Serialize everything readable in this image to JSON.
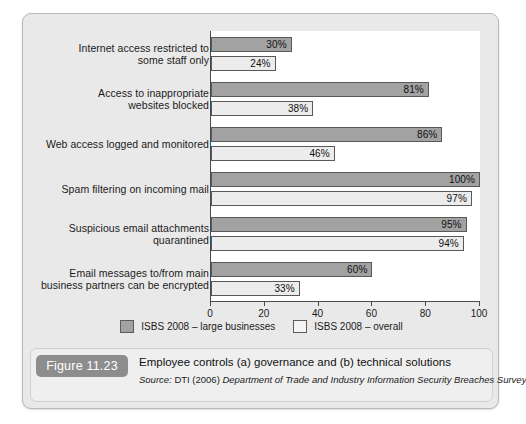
{
  "figure": {
    "badge": "Figure 11.23",
    "title": "Employee controls (a) governance and (b) technical solutions",
    "source_prefix": "Source:",
    "source_org": " DTI (2006) ",
    "source_title": "Department of Trade and Industry Information Security Breaches Survey"
  },
  "legend": {
    "items": [
      {
        "label": "ISBS 2008 – large businesses",
        "color": "#a2a2a2",
        "key": "large"
      },
      {
        "label": "ISBS 2008 – overall",
        "color": "#f4f4f4",
        "key": "overall"
      }
    ]
  },
  "chart_data": {
    "type": "bar",
    "orientation": "horizontal",
    "title": "Employee controls (a) governance and (b) technical solutions",
    "xlabel": "",
    "ylabel": "",
    "xlim": [
      0,
      100
    ],
    "xticks": [
      0,
      20,
      40,
      60,
      80,
      100
    ],
    "xtick_labels": [
      "0",
      "20",
      "40",
      "60",
      "80",
      "100"
    ],
    "grid": false,
    "legend_position": "bottom",
    "value_suffix": "%",
    "categories": [
      "Internet access restricted to\nsome staff only",
      "Access to inappropriate\nwebsites blocked",
      "Web access logged and monitored",
      "Spam filtering on incoming mail",
      "Suspicious email attachments\nquarantined",
      "Email messages to/from main\nbusiness partners can be encrypted"
    ],
    "series": [
      {
        "name": "ISBS 2008 – large businesses",
        "color": "#a2a2a2",
        "values": [
          30,
          81,
          86,
          100,
          95,
          60
        ],
        "labels": [
          "30%",
          "81%",
          "86%",
          "100%",
          "95%",
          "60%"
        ]
      },
      {
        "name": "ISBS 2008 – overall",
        "color": "#ececec",
        "values": [
          24,
          38,
          46,
          97,
          94,
          33
        ],
        "labels": [
          "24%",
          "38%",
          "46%",
          "97%",
          "94%",
          "33%"
        ]
      }
    ]
  }
}
